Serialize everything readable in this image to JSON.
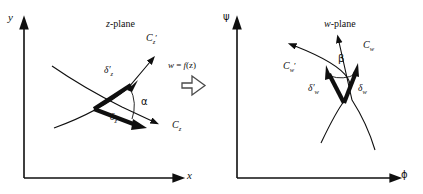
{
  "figure": {
    "caption_type": "conformal-mapping-diagram",
    "background_color": "#ffffff",
    "stroke_color": "#0f0f0f"
  },
  "left_panel": {
    "title_italic": "z",
    "title_rest": "-plane",
    "y_axis_label": "y",
    "x_axis_label": "x",
    "curve_primed_label": "C",
    "curve_primed_sub": "z",
    "curve_primed_prime": "′",
    "curve_label": "C",
    "curve_sub": "z",
    "delta_primed": "δ′",
    "delta_primed_sub": "z",
    "delta": "δ",
    "delta_sub": "z",
    "angle_label": "α"
  },
  "mapping": {
    "equation_w": "w",
    "equation_eq": " = ",
    "equation_f": "f",
    "equation_arg": "(z)",
    "arrow_icon": "right-arrow-icon"
  },
  "right_panel": {
    "title_italic": "w",
    "title_rest": "-plane",
    "y_axis_label": "ψ",
    "x_axis_label": "ϕ",
    "curve_primed_label": "C",
    "curve_primed_sub": "w",
    "curve_primed_prime": "′",
    "curve_label": "C",
    "curve_sub": "w",
    "delta_primed": "δ′",
    "delta_primed_sub": "w",
    "delta": "δ",
    "delta_sub": "w",
    "angle_label": "β"
  }
}
